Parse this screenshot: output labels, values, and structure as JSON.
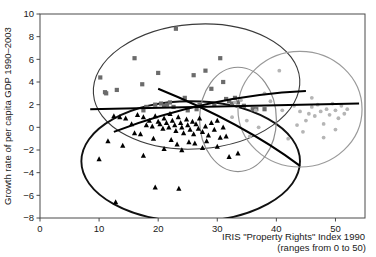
{
  "chart_data": {
    "type": "scatter",
    "title": "",
    "xlabel": "IRIS \"Property Rights\" Index 1990",
    "xlabel_line2": "(ranges from 0 to 50)",
    "ylabel": "Growth rate of per capita GDP 1990–2003",
    "xlim": [
      0,
      55
    ],
    "ylim": [
      -8,
      10
    ],
    "xticks": [
      0,
      10,
      20,
      30,
      40,
      50
    ],
    "xtick_labels": [
      "0",
      "10",
      "20",
      "30",
      "40",
      "50"
    ],
    "yticks": [
      -8,
      -6,
      -4,
      -2,
      0,
      2,
      4,
      6,
      8,
      10
    ],
    "ytick_labels": [
      "−8",
      "−6",
      "−4",
      "−2",
      "0",
      "2",
      "4",
      "6",
      "8",
      "10"
    ],
    "grid": false,
    "legend": "none",
    "series": [
      {
        "name": "group-squares",
        "marker": "square",
        "color": "#6b6b6b",
        "points": [
          [
            10.2,
            4.4
          ],
          [
            11.0,
            3.1
          ],
          [
            11.2,
            3.0
          ],
          [
            13.0,
            3.3
          ],
          [
            16.0,
            6.1
          ],
          [
            17.3,
            3.8
          ],
          [
            19.5,
            2.0
          ],
          [
            20.5,
            2.1
          ],
          [
            21.0,
            1.9
          ],
          [
            21.5,
            2.0
          ],
          [
            22.0,
            2.2
          ],
          [
            22.6,
            1.8
          ],
          [
            20.0,
            4.8
          ],
          [
            23.0,
            8.7
          ],
          [
            24.5,
            2.6
          ],
          [
            26.0,
            4.6
          ],
          [
            26.5,
            1.6
          ],
          [
            27.0,
            2.0
          ],
          [
            28.0,
            5.0
          ],
          [
            29.0,
            3.4
          ],
          [
            29.5,
            2.0
          ],
          [
            30.5,
            6.1
          ],
          [
            31.0,
            4.0
          ],
          [
            31.5,
            2.5
          ],
          [
            32.0,
            2.3
          ],
          [
            32.5,
            2.1
          ],
          [
            33.0,
            2.6
          ],
          [
            33.5,
            2.2
          ],
          [
            34.5,
            1.9
          ],
          [
            36.0,
            1.6
          ],
          [
            36.6,
            1.6
          ],
          [
            38.0,
            1.6
          ],
          [
            25.0,
            1.5
          ],
          [
            18.0,
            1.8
          ],
          [
            17.5,
            1.5
          ]
        ]
      },
      {
        "name": "group-triangles",
        "marker": "triangle",
        "color": "#000000",
        "points": [
          [
            16.5,
            1.1
          ],
          [
            17.5,
            0.9
          ],
          [
            18.0,
            0.2
          ],
          [
            18.5,
            0.6
          ],
          [
            19.0,
            0.1
          ],
          [
            19.5,
            1.0
          ],
          [
            20.0,
            0.5
          ],
          [
            20.3,
            0.3
          ],
          [
            20.8,
            -0.1
          ],
          [
            21.0,
            0.8
          ],
          [
            21.4,
            0.4
          ],
          [
            21.8,
            0.0
          ],
          [
            22.0,
            1.2
          ],
          [
            22.4,
            0.6
          ],
          [
            22.8,
            0.2
          ],
          [
            23.0,
            -0.3
          ],
          [
            23.4,
            0.9
          ],
          [
            23.8,
            0.4
          ],
          [
            24.0,
            0.0
          ],
          [
            24.3,
            -0.5
          ],
          [
            24.8,
            0.7
          ],
          [
            25.0,
            0.2
          ],
          [
            25.4,
            -0.2
          ],
          [
            25.8,
            0.5
          ],
          [
            26.0,
            -0.6
          ],
          [
            26.4,
            0.3
          ],
          [
            26.8,
            -0.1
          ],
          [
            27.0,
            0.8
          ],
          [
            27.5,
            -0.4
          ],
          [
            28.0,
            0.1
          ],
          [
            28.5,
            -0.7
          ],
          [
            29.0,
            0.4
          ],
          [
            29.5,
            -0.2
          ],
          [
            30.0,
            0.6
          ],
          [
            30.5,
            -0.9
          ],
          [
            31.0,
            0.0
          ],
          [
            14.5,
            0.8
          ],
          [
            15.5,
            0.3
          ],
          [
            13.5,
            0.9
          ],
          [
            12.5,
            1.0
          ],
          [
            16.0,
            -0.5
          ],
          [
            17.0,
            -0.6
          ],
          [
            19.2,
            -1.0
          ],
          [
            22.2,
            -1.1
          ],
          [
            25.2,
            -1.3
          ],
          [
            28.2,
            -1.2
          ],
          [
            23.2,
            -1.5
          ],
          [
            26.2,
            -1.4
          ],
          [
            10.0,
            -2.8
          ],
          [
            17.5,
            -2.5
          ],
          [
            21.0,
            -1.9
          ],
          [
            24.0,
            -2.0
          ],
          [
            27.5,
            -1.8
          ],
          [
            30.0,
            -1.7
          ],
          [
            12.8,
            -6.6
          ],
          [
            19.5,
            -5.3
          ],
          [
            23.5,
            -5.4
          ],
          [
            31.5,
            -0.8
          ],
          [
            32.0,
            -2.6
          ],
          [
            33.5,
            -2.3
          ],
          [
            14.0,
            -1.6
          ],
          [
            11.5,
            -1.2
          ]
        ]
      },
      {
        "name": "group-circles",
        "marker": "circle",
        "color": "#b5b5b5",
        "points": [
          [
            33.0,
            2.2
          ],
          [
            33.5,
            1.9
          ],
          [
            34.0,
            2.4
          ],
          [
            35.0,
            0.6
          ],
          [
            36.5,
            1.5
          ],
          [
            38.0,
            3.0
          ],
          [
            39.0,
            2.3
          ],
          [
            40.5,
            5.0
          ],
          [
            41.0,
            1.5
          ],
          [
            42.0,
            -1.0
          ],
          [
            43.0,
            1.9
          ],
          [
            44.0,
            1.4
          ],
          [
            45.0,
            0.6
          ],
          [
            45.5,
            1.2
          ],
          [
            46.0,
            1.8
          ],
          [
            46.5,
            1.0
          ],
          [
            47.0,
            2.0
          ],
          [
            47.5,
            1.4
          ],
          [
            48.0,
            0.3
          ],
          [
            48.5,
            1.6
          ],
          [
            49.0,
            1.1
          ],
          [
            49.5,
            2.1
          ],
          [
            50.0,
            1.5
          ],
          [
            50.5,
            0.8
          ],
          [
            51.0,
            1.9
          ],
          [
            51.5,
            1.2
          ],
          [
            52.0,
            1.6
          ],
          [
            48.0,
            -0.9
          ],
          [
            44.5,
            -0.4
          ],
          [
            50.0,
            -0.2
          ],
          [
            35.5,
            -0.8
          ],
          [
            37.0,
            0.0
          ],
          [
            32.5,
            0.9
          ],
          [
            43.5,
            0.2
          ],
          [
            46.0,
            2.6
          ]
        ]
      }
    ],
    "ellipses": [
      {
        "name": "ellipse-squares",
        "cx": 26.5,
        "cy": 3.6,
        "rx": 17.5,
        "ry": 5.5,
        "rot": -4,
        "color": "#3a3a3a",
        "width": 1.1
      },
      {
        "name": "ellipse-triangles",
        "cx": 25.5,
        "cy": -3.0,
        "rx": 18.5,
        "ry": 5.3,
        "rot": 0,
        "color": "#111111",
        "width": 1.9
      },
      {
        "name": "ellipse-circles",
        "cx": 44.0,
        "cy": 1.6,
        "rx": 10.5,
        "ry": 5.1,
        "rot": 0,
        "color": "#9a9a9a",
        "width": 1.2
      },
      {
        "name": "ellipse-mid",
        "cx": 33.5,
        "cy": 0.7,
        "rx": 6.5,
        "ry": 4.6,
        "rot": 0,
        "color": "#8d8d8d",
        "width": 1.2
      }
    ],
    "trendlines": [
      {
        "name": "trendline-flat",
        "x1": 8.5,
        "y1": 1.6,
        "x2": 54.0,
        "y2": 2.1,
        "color": "#000000",
        "width": 2.0
      },
      {
        "name": "trendline-rising",
        "x1": 12.5,
        "y1": -0.4,
        "x2": 45.0,
        "y2": 3.2,
        "color": "#000000",
        "width": 2.0
      },
      {
        "name": "trendline-falling",
        "x1": 20.0,
        "y1": 3.4,
        "x2": 44.0,
        "y2": -3.4,
        "color": "#000000",
        "width": 2.0
      }
    ]
  }
}
